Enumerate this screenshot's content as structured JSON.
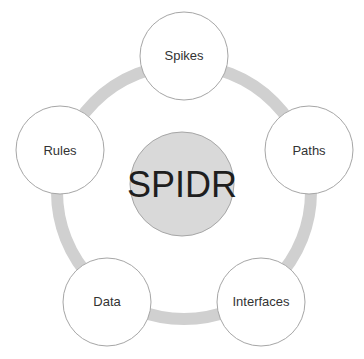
{
  "diagram": {
    "type": "cycle",
    "center": {
      "label": "SPIDR",
      "fill": "#d9d9d9",
      "stroke": "#a6a6a6",
      "text_color": "#1e1e1e"
    },
    "ring": {
      "color": "#d0d0d0"
    },
    "nodes": [
      {
        "label": "Spikes"
      },
      {
        "label": "Paths"
      },
      {
        "label": "Interfaces"
      },
      {
        "label": "Data"
      },
      {
        "label": "Rules"
      }
    ],
    "node_style": {
      "fill": "#ffffff",
      "stroke": "#a6a6a6",
      "text_color": "#333333"
    }
  }
}
